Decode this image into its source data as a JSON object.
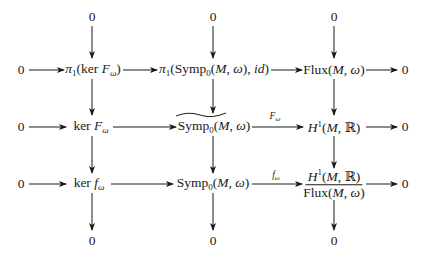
{
  "diagram": {
    "type": "commutative-diagram",
    "rows": [
      {
        "left": "",
        "nodes": [
          "0",
          "0",
          "0"
        ],
        "right": ""
      },
      {
        "left": "0",
        "nodes": [
          "π₁(ker F_ω)",
          "π₁(Symp₀(M, ω), id)",
          "Flux(M, ω)"
        ],
        "right": "0"
      },
      {
        "left": "0",
        "nodes": [
          "ker F_ω",
          "~Symp₀(M, ω)",
          "H¹(M, ℝ)"
        ],
        "right": "0",
        "arrow_labels": [
          "",
          "F_ω"
        ]
      },
      {
        "left": "0",
        "nodes": [
          "ker f_ω",
          "Symp₀(M, ω)",
          "H¹(M, ℝ) / Flux(M, ω)"
        ],
        "right": "0",
        "arrow_labels": [
          "",
          "f_ω"
        ]
      },
      {
        "left": "",
        "nodes": [
          "0",
          "0",
          "0"
        ],
        "right": ""
      }
    ],
    "labels": {
      "zero": "0",
      "pi1": "π",
      "sub1": "1",
      "sub0": "0",
      "ker": "ker",
      "F": "F",
      "f": "f",
      "omega": "ω",
      "symp": "Symp",
      "flux": "Flux",
      "H": "H",
      "sup1": "1",
      "M": "M",
      "R": "ℝ",
      "id": "id",
      "comma": ", ",
      "lparen": "(",
      "rparen": ")"
    }
  }
}
